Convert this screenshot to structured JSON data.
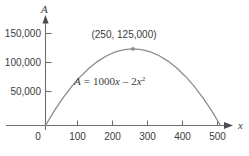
{
  "chart_data": {
    "type": "line",
    "title": "",
    "xlabel": "x",
    "ylabel": "A",
    "equation": "A = 1000x - 2x^2",
    "equation_parts": {
      "lhs": "A",
      "eq": "=",
      "coef": "1000",
      "var1": "x",
      "minus": "–",
      "coef2": "2",
      "var2": "x",
      "exp2": "2"
    },
    "xlim": [
      -60,
      560
    ],
    "ylim": [
      0,
      160000
    ],
    "xticks": [
      0,
      100,
      200,
      300,
      400,
      500
    ],
    "xticklabels": [
      "0",
      "100",
      "200",
      "300",
      "400",
      "500"
    ],
    "yticks": [
      50000,
      100000,
      150000
    ],
    "yticklabels": [
      "50,000",
      "100,000",
      "150,000"
    ],
    "grid": false,
    "legend": false,
    "series": [
      {
        "name": "A = 1000x - 2x^2",
        "color": "#8c8c8c",
        "x": [
          0,
          25,
          50,
          75,
          100,
          125,
          150,
          175,
          200,
          225,
          250,
          275,
          300,
          325,
          350,
          375,
          400,
          425,
          450,
          475,
          500
        ],
        "y": [
          0,
          23750,
          45000,
          63750,
          80000,
          93750,
          105000,
          113750,
          120000,
          123750,
          125000,
          123750,
          120000,
          113750,
          105000,
          93750,
          80000,
          63750,
          45000,
          23750,
          0
        ]
      }
    ],
    "annotations": [
      {
        "label": "(250, 125,000)",
        "x": 250,
        "y": 125000,
        "marker": "dot",
        "marker_color": "#8c8c8c"
      }
    ],
    "colors": {
      "curve": "#8c8c8c",
      "axis": "#6f6f6f",
      "text": "#3c3c3c",
      "background": "#ffffff"
    }
  }
}
